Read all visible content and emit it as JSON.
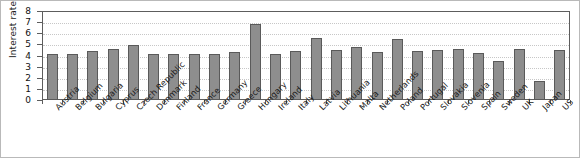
{
  "chart_data": {
    "type": "bar",
    "title": "",
    "xlabel": "",
    "ylabel": "Interest rate (%)",
    "ylim": [
      0,
      8
    ],
    "yticks": [
      0,
      1,
      2,
      3,
      4,
      5,
      6,
      7,
      8
    ],
    "grid": true,
    "legend": null,
    "categories": [
      "Austria",
      "Belgium",
      "Bulgaria",
      "Cyprus",
      "Czech Republic",
      "Denmark",
      "Finland",
      "France",
      "Germany",
      "Greece",
      "Hungary",
      "Ireland",
      "Italy",
      "Latvia",
      "Lithuania",
      "Malta",
      "Netherlands",
      "Poland",
      "Portugal",
      "Slovakia",
      "Slovenia",
      "Spain",
      "Sweden",
      "UK",
      "Japan",
      "US"
    ],
    "values": [
      4.1,
      4.1,
      4.4,
      4.55,
      4.95,
      4.1,
      4.1,
      4.1,
      4.1,
      4.35,
      6.8,
      4.1,
      4.4,
      5.6,
      4.5,
      4.8,
      4.3,
      5.5,
      4.4,
      4.5,
      4.55,
      4.25,
      3.5,
      4.6,
      1.75,
      4.5
    ],
    "bar_color": "#8e8e8e",
    "bar_edge_color": "#5a5a5a",
    "grid_color": "#c7c7c7",
    "axis_color": "#5d5d5d"
  }
}
